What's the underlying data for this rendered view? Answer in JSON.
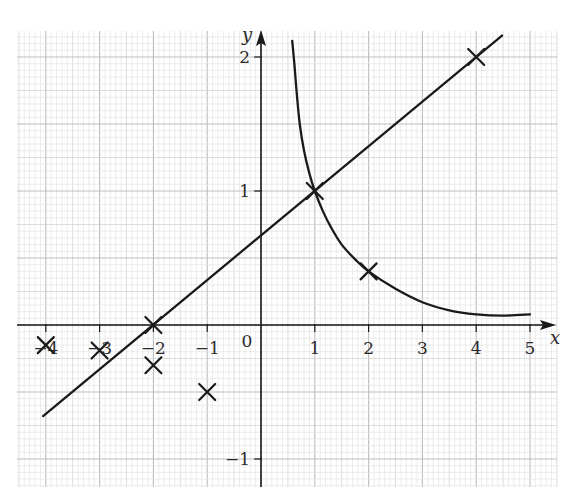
{
  "chart_data": {
    "type": "scatter",
    "title": "",
    "xlabel": "x",
    "ylabel": "y",
    "xlim": [
      -4.5,
      5.3
    ],
    "ylim": [
      -1.2,
      2.2
    ],
    "grid": true,
    "grid_style": "graph paper (fine minor grid, heavier major lines)",
    "x_ticks": [
      -4,
      -3,
      -2,
      -1,
      1,
      2,
      3,
      4,
      5
    ],
    "x_tick_labels": [
      "−4",
      "−3",
      "−2",
      "−1",
      "1",
      "2",
      "3",
      "4",
      "5"
    ],
    "y_ticks": [
      -1,
      1,
      2
    ],
    "y_tick_labels": [
      "−1",
      "1",
      "2"
    ],
    "origin_label": "0",
    "series": [
      {
        "name": "line",
        "type": "line",
        "equation": "y = (x + 2) / 3",
        "x": [
          -4.05,
          4.48
        ],
        "y": [
          -0.68,
          2.16
        ]
      },
      {
        "name": "curve",
        "type": "line",
        "x": [
          0.58,
          0.62,
          0.66,
          0.72,
          0.8,
          0.9,
          1.0,
          1.15,
          1.3,
          1.5,
          1.75,
          2.0,
          2.5,
          3.0,
          3.5,
          4.0,
          4.5,
          5.0
        ],
        "y": [
          2.12,
          1.95,
          1.75,
          1.5,
          1.3,
          1.13,
          1.0,
          0.85,
          0.73,
          0.6,
          0.49,
          0.4,
          0.27,
          0.17,
          0.11,
          0.08,
          0.07,
          0.08
        ]
      },
      {
        "name": "plotted points",
        "type": "scatter",
        "marker": "x",
        "x": [
          -4,
          -3,
          -2,
          -2,
          -1,
          1,
          2,
          4
        ],
        "y": [
          -0.15,
          -0.19,
          0,
          -0.3,
          -0.5,
          1,
          0.4,
          2
        ]
      }
    ],
    "colors": {
      "ink": "#1a1a1a",
      "grid_minor": "#e4e4e4",
      "grid_major": "#c8c8c8",
      "background": "#ffffff"
    }
  }
}
